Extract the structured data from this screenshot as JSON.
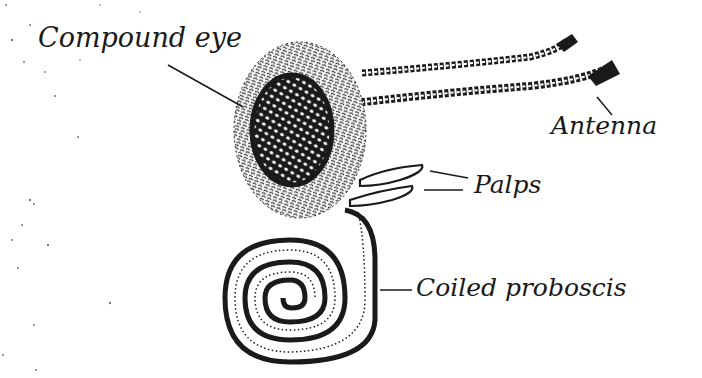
{
  "figure": {
    "background_color": "#ffffff",
    "ink_color": "#1a1a1a",
    "labels": [
      {
        "id": "compound-eye",
        "text": "Compound eye"
      },
      {
        "id": "antenna",
        "text": "Antenna"
      },
      {
        "id": "palps",
        "text": "Palps"
      },
      {
        "id": "coiled-proboscis",
        "text": "Coiled proboscis"
      }
    ]
  }
}
